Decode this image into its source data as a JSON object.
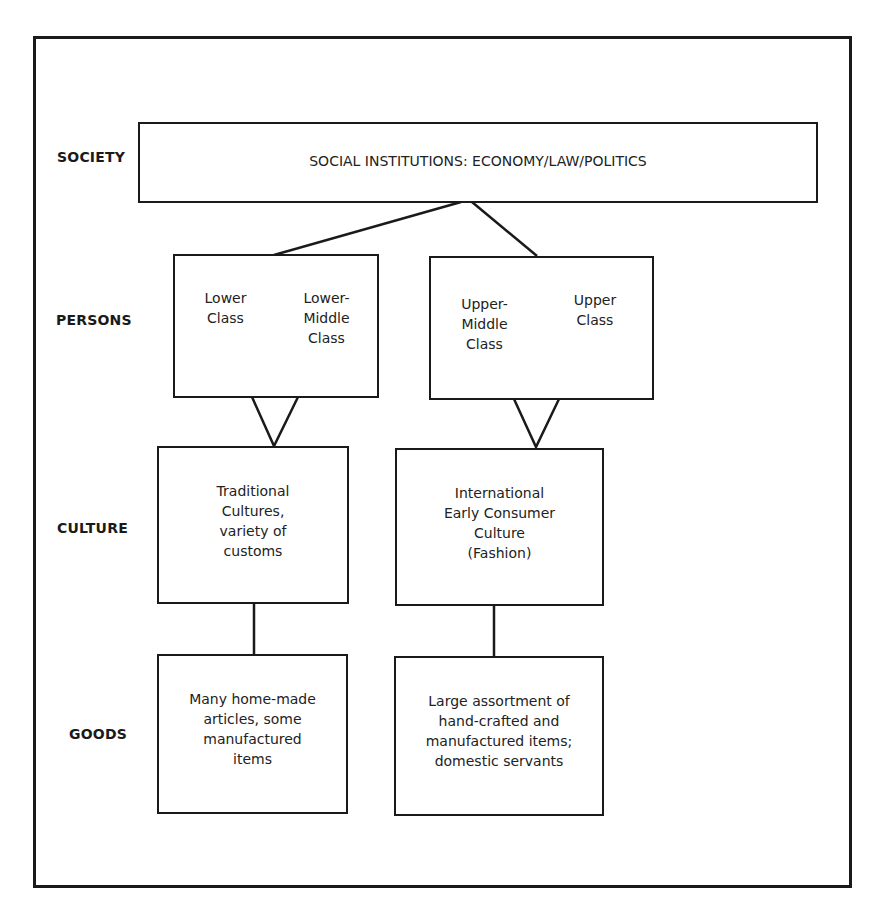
{
  "diagram": {
    "row_labels": {
      "society": "SOCIETY",
      "persons": "PERSONS",
      "culture": "CULTURE",
      "goods": "GOODS"
    },
    "society": {
      "text": "SOCIAL INSTITUTIONS:  ECONOMY/LAW/POLITICS"
    },
    "persons": {
      "left": {
        "a": "Lower\nClass",
        "b": "Lower-\nMiddle\nClass"
      },
      "right": {
        "a": "Upper-\nMiddle\nClass",
        "b": "Upper\nClass"
      }
    },
    "culture": {
      "left": "Traditional\nCultures,\nvariety of\ncustoms",
      "right": "International\nEarly Consumer\nCulture\n(Fashion)"
    },
    "goods": {
      "left": "Many home-made\narticles, some\nmanufactured\nitems",
      "right": "Large assortment of\nhand-crafted and\nmanufactured items;\ndomestic servants"
    },
    "colors": {
      "line": "#1a1a1a",
      "background": "#ffffff"
    }
  }
}
